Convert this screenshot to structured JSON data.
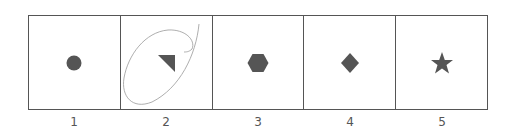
{
  "diagram": {
    "shape_color": "#555555",
    "border_color": "#555555",
    "cells": [
      {
        "label": "1",
        "shape": "circle"
      },
      {
        "label": "2",
        "shape": "triangle",
        "annotated": true
      },
      {
        "label": "3",
        "shape": "hexagon"
      },
      {
        "label": "4",
        "shape": "diamond"
      },
      {
        "label": "5",
        "shape": "star"
      }
    ],
    "annotation": {
      "type": "hand-drawn-loop",
      "cell": "2",
      "color": "#999999"
    }
  }
}
